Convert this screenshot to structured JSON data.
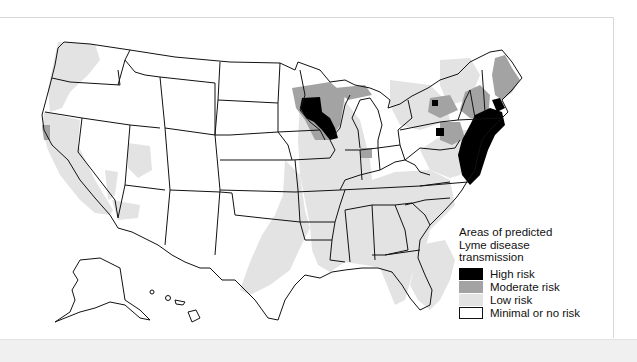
{
  "legend": {
    "title_lines": [
      "Areas of predicted",
      "Lyme disease",
      "transmission"
    ],
    "items": [
      {
        "label": "High risk",
        "color": "#000000"
      },
      {
        "label": "Moderate risk",
        "color": "#a3a3a3"
      },
      {
        "label": "Low risk",
        "color": "#e3e3e3"
      },
      {
        "label": "Minimal or no risk",
        "color": "#ffffff"
      }
    ]
  },
  "colors": {
    "high": "#000000",
    "moderate": "#a3a3a3",
    "low": "#e3e3e3",
    "none": "#ffffff",
    "border": "#111111"
  }
}
